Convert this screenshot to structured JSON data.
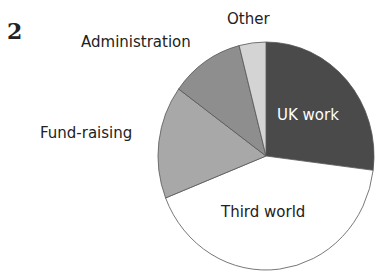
{
  "figure_number": "2",
  "chart_data": {
    "type": "pie",
    "title": "",
    "start_angle_deg": 0,
    "direction": "clockwise",
    "slices": [
      {
        "label": "UK work",
        "value": 27,
        "color": "#4a4a4a",
        "label_color": "#ffffff"
      },
      {
        "label": "Third world",
        "value": 42,
        "color": "#ffffff",
        "label_color": "#222222"
      },
      {
        "label": "Fund-raising",
        "value": 16,
        "color": "#a8a8a8",
        "label_color": "#222222"
      },
      {
        "label": "Administration",
        "value": 11,
        "color": "#8e8e8e",
        "label_color": "#222222"
      },
      {
        "label": "Other",
        "value": 4,
        "color": "#d4d4d4",
        "label_color": "#222222"
      }
    ],
    "unit": "%",
    "legend": "none (direct labels)"
  }
}
